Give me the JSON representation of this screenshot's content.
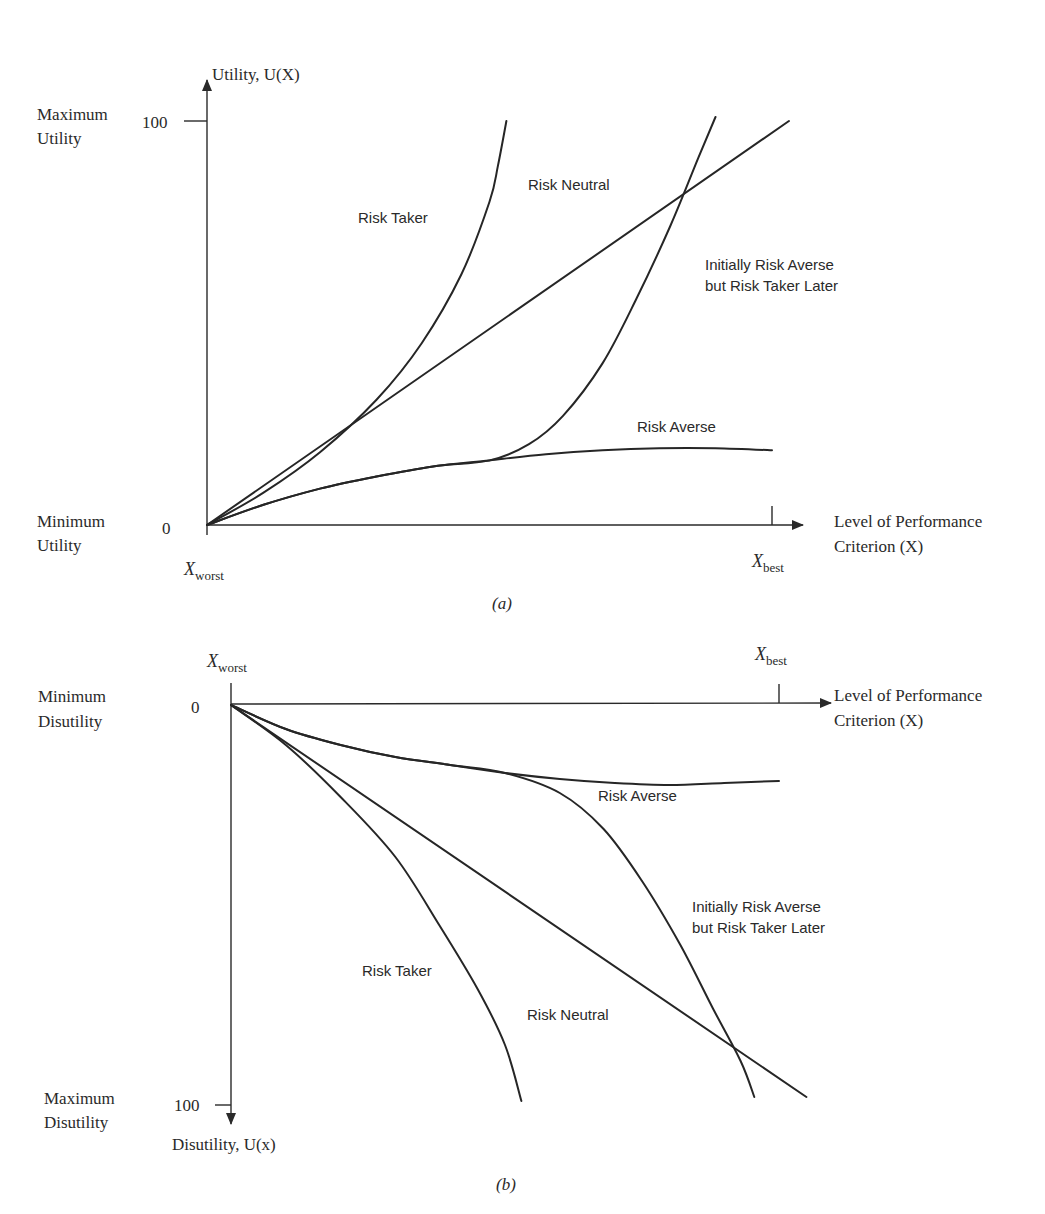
{
  "chart_data": [
    {
      "type": "line",
      "panel": "a",
      "caption": "(a)",
      "ylabel": "Utility, U(X)",
      "xlabel_lines": [
        "Level of Performance",
        "Criterion (X)"
      ],
      "y_top_label": [
        "Maximum",
        "Utility"
      ],
      "y_bottom_label": [
        "Minimum",
        "Utility"
      ],
      "y_ticks": [
        "0",
        "100"
      ],
      "x_tick_labels": {
        "worst": "X",
        "worst_sub": "worst",
        "best": "X",
        "best_sub": "best"
      },
      "xlim": [
        0,
        1
      ],
      "ylim": [
        0,
        100
      ],
      "x_description": "fraction of range from X_worst (0) to X_best (1)",
      "series": [
        {
          "name": "Risk Taker",
          "points": [
            [
              0,
              0
            ],
            [
              0.1,
              8
            ],
            [
              0.2,
              18
            ],
            [
              0.3,
              31
            ],
            [
              0.38,
              45
            ],
            [
              0.45,
              62
            ],
            [
              0.5,
              80
            ],
            [
              0.515,
              89
            ],
            [
              0.53,
              100
            ]
          ]
        },
        {
          "name": "Risk Neutral",
          "points": [
            [
              0,
              0
            ],
            [
              1.03,
              100
            ]
          ]
        },
        {
          "name": "Risk Averse",
          "points": [
            [
              0,
              0
            ],
            [
              0.1,
              5
            ],
            [
              0.2,
              9
            ],
            [
              0.3,
              12
            ],
            [
              0.4,
              14.5
            ],
            [
              0.5,
              16
            ],
            [
              0.6,
              17.5
            ],
            [
              0.7,
              18.5
            ],
            [
              0.8,
              19
            ],
            [
              0.9,
              19
            ],
            [
              1.0,
              18.5
            ]
          ]
        },
        {
          "name": "Initially Risk Averse but Risk Taker Later",
          "points": [
            [
              0,
              0
            ],
            [
              0.1,
              5
            ],
            [
              0.2,
              9
            ],
            [
              0.3,
              12
            ],
            [
              0.4,
              14.5
            ],
            [
              0.5,
              16
            ],
            [
              0.57,
              20
            ],
            [
              0.63,
              27
            ],
            [
              0.7,
              40
            ],
            [
              0.76,
              56
            ],
            [
              0.82,
              74
            ],
            [
              0.87,
              91
            ],
            [
              0.9,
              101
            ]
          ]
        }
      ],
      "annotations": [
        {
          "text": "Risk Taker",
          "series": "Risk Taker"
        },
        {
          "text": "Risk Neutral",
          "series": "Risk Neutral"
        },
        {
          "text": "Risk Averse",
          "series": "Risk Averse"
        },
        {
          "lines": [
            "Initially Risk Averse",
            "but Risk Taker Later"
          ],
          "series": "Initially Risk Averse but Risk Taker Later"
        }
      ]
    },
    {
      "type": "line",
      "panel": "b",
      "caption": "(b)",
      "ylabel": "Disutility, U(x)",
      "xlabel_lines": [
        "Level of Performance",
        "Criterion (X)"
      ],
      "y_top_label": [
        "Minimum",
        "Disutility"
      ],
      "y_bottom_label": [
        "Maximum",
        "Disutility"
      ],
      "y_ticks": [
        "0",
        "100"
      ],
      "x_tick_labels": {
        "worst": "X",
        "worst_sub": "worst",
        "best": "X",
        "best_sub": "best"
      },
      "xlim": [
        0,
        1
      ],
      "ylim": [
        0,
        100
      ],
      "y_inverted": true,
      "x_description": "fraction of range from X_worst (0) to X_best (1)",
      "series": [
        {
          "name": "Risk Taker",
          "points": [
            [
              0,
              0
            ],
            [
              0.1,
              10
            ],
            [
              0.2,
              23
            ],
            [
              0.3,
              38
            ],
            [
              0.38,
              55
            ],
            [
              0.45,
              71
            ],
            [
              0.5,
              85
            ],
            [
              0.53,
              99
            ]
          ]
        },
        {
          "name": "Risk Neutral",
          "points": [
            [
              0,
              0
            ],
            [
              1.05,
              98
            ]
          ]
        },
        {
          "name": "Risk Averse",
          "points": [
            [
              0,
              0
            ],
            [
              0.1,
              6
            ],
            [
              0.2,
              10
            ],
            [
              0.3,
              13
            ],
            [
              0.4,
              15
            ],
            [
              0.5,
              17
            ],
            [
              0.6,
              18.5
            ],
            [
              0.7,
              19.5
            ],
            [
              0.8,
              20
            ],
            [
              0.9,
              19.5
            ],
            [
              1.0,
              19
            ]
          ]
        },
        {
          "name": "Initially Risk Averse but Risk Taker Later",
          "points": [
            [
              0,
              0
            ],
            [
              0.1,
              6
            ],
            [
              0.2,
              10
            ],
            [
              0.3,
              13
            ],
            [
              0.4,
              15
            ],
            [
              0.5,
              17
            ],
            [
              0.6,
              22
            ],
            [
              0.68,
              31
            ],
            [
              0.75,
              44
            ],
            [
              0.82,
              60
            ],
            [
              0.88,
              76
            ],
            [
              0.93,
              89
            ],
            [
              0.955,
              98
            ]
          ]
        }
      ],
      "annotations": [
        {
          "text": "Risk Averse",
          "series": "Risk Averse"
        },
        {
          "lines": [
            "Initially Risk Averse",
            "but Risk Taker Later"
          ],
          "series": "Initially Risk Averse but Risk Taker Later"
        },
        {
          "text": "Risk Taker",
          "series": "Risk Taker"
        },
        {
          "text": "Risk Neutral",
          "series": "Risk Neutral"
        }
      ]
    }
  ]
}
